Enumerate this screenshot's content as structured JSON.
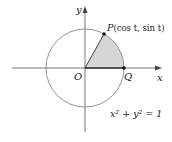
{
  "diagram": {
    "labels": {
      "y_axis": "y",
      "x_axis": "x",
      "origin": "O",
      "point_q": "Q",
      "point_p_name": "P",
      "point_p_coords": "(cos t, sin t)",
      "equation": "x² + y² = 1"
    },
    "colors": {
      "circle": "#8a8a8a",
      "axes": "#555555",
      "sector_fill": "#d6d6d6",
      "points": "#111111"
    }
  }
}
